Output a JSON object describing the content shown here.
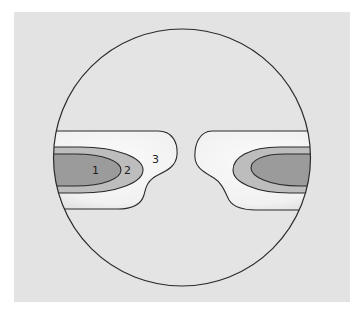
{
  "diagram": {
    "type": "circular field with two symmetric lobes of nested zones",
    "colors": {
      "canvas": "#ffffff",
      "panel": "#e3e3e3",
      "circle_fill": "#e4e4e4",
      "outline": "#2a2a2a",
      "zone1": "#9b9b9b",
      "zone2": "#bdbdbd",
      "zone3_light": "#fafafa",
      "zone3_shade": "#dcdcdc"
    },
    "zones": [
      {
        "id": "1",
        "label": "1",
        "description": "innermost dark zone"
      },
      {
        "id": "2",
        "label": "2",
        "description": "middle zone"
      },
      {
        "id": "3",
        "label": "3",
        "description": "outer light zone"
      }
    ],
    "labels": {
      "zone1": "1",
      "zone2": "2",
      "zone3": "3"
    }
  }
}
